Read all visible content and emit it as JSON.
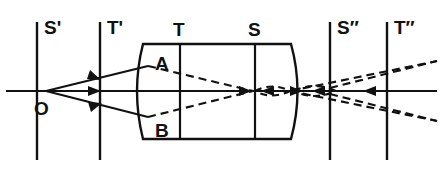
{
  "figure": {
    "type": "optical-ray-diagram",
    "background_color": "#ffffff",
    "ink_color": "#111111",
    "width": 443,
    "height": 181
  },
  "labels": {
    "object_point": "O",
    "surface_plane_s_prime": "S'",
    "surface_plane_t_prime": "T'",
    "lens_plane_t": "T",
    "lens_plane_s": "S",
    "image_plane_s_double_prime": "S″",
    "image_plane_t_double_prime": "T″",
    "ray_hit_upper": "A",
    "ray_hit_lower": "B"
  },
  "label_positions": {
    "s_prime": {
      "x": 44,
      "y": 30
    },
    "t_prime": {
      "x": 107,
      "y": 30
    },
    "t": {
      "x": 174,
      "y": 32
    },
    "s": {
      "x": 249,
      "y": 32
    },
    "s_double_prime": {
      "x": 337,
      "y": 30
    },
    "t_double_prime": {
      "x": 394,
      "y": 30
    },
    "o": {
      "x": 36,
      "y": 110
    },
    "a": {
      "x": 158,
      "y": 62
    },
    "b": {
      "x": 158,
      "y": 132
    }
  },
  "geometry": {
    "optical_axis": {
      "x1": 6,
      "y": 91,
      "x2": 437
    },
    "object_point": {
      "x": 46,
      "y": 91
    },
    "vertical_reference_lines": [
      {
        "name": "S'",
        "x": 37,
        "y_top": 22,
        "y_bottom": 160
      },
      {
        "name": "T'",
        "x": 100,
        "y_top": 22,
        "y_bottom": 160
      },
      {
        "name": "S″",
        "x": 330,
        "y_top": 22,
        "y_bottom": 160
      },
      {
        "name": "T″",
        "x": 387,
        "y_top": 22,
        "y_bottom": 160
      }
    ],
    "lens": {
      "left_x": 143,
      "right_x": 291,
      "top_y": 44,
      "bottom_y": 139,
      "left_face_bulge": -12,
      "right_face_bulge": 13,
      "internal_lines": [
        {
          "name": "T",
          "x": 180
        },
        {
          "name": "S",
          "x": 255
        }
      ]
    },
    "incident_rays": [
      {
        "from": "O",
        "to": "A",
        "x1": 46,
        "y1": 91,
        "x2": 148,
        "y2": 66,
        "arrow_at": 0.52
      },
      {
        "from": "O",
        "to": "axis",
        "x1": 46,
        "y1": 91,
        "x2": 148,
        "y2": 91,
        "arrow_at": 0.52
      },
      {
        "from": "O",
        "to": "B",
        "x1": 46,
        "y1": 91,
        "x2": 148,
        "y2": 117,
        "arrow_at": 0.52
      }
    ],
    "refracted_rays": [
      {
        "from": "A",
        "x1": 148,
        "y1": 66,
        "x2": 253,
        "y2": 91
      },
      {
        "from": "B",
        "x1": 148,
        "y1": 117,
        "x2": 253,
        "y2": 91
      }
    ],
    "focus_points": [
      {
        "name": "tangential-focus",
        "x": 253,
        "y": 91
      },
      {
        "name": "sagittal-focus",
        "x": 314,
        "y": 91
      }
    ],
    "diverging_rays": [
      {
        "x1": 253,
        "y1": 91,
        "x2": 437,
        "y2": 61
      },
      {
        "x1": 253,
        "y1": 91,
        "x2": 437,
        "y2": 121
      }
    ],
    "caustic_loops": [
      {
        "cx": 272,
        "cy": 91,
        "rx": 20,
        "ry": 7
      },
      {
        "cx": 314,
        "cy": 91,
        "rx": 22,
        "ry": 8
      }
    ],
    "axis_arrow_marks": [
      {
        "x": 243,
        "y": 91,
        "dir": "right"
      },
      {
        "x": 268,
        "y": 91,
        "dir": "left"
      },
      {
        "x": 300,
        "y": 91,
        "dir": "right"
      },
      {
        "x": 326,
        "y": 91,
        "dir": "left"
      },
      {
        "x": 372,
        "y": 91,
        "dir": "left"
      }
    ]
  }
}
